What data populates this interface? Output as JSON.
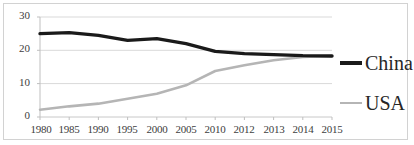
{
  "chart_data": {
    "type": "line",
    "title": "",
    "xlabel": "",
    "ylabel": "",
    "categories": [
      "1980",
      "1985",
      "1990",
      "1995",
      "2000",
      "2005",
      "2010",
      "2012",
      "2013",
      "2014",
      "2015"
    ],
    "series": [
      {
        "name": "China",
        "color": "#1a1a1a",
        "values": [
          25.0,
          25.3,
          24.5,
          23.0,
          23.5,
          22.0,
          19.7,
          19.0,
          18.7,
          18.4,
          18.3
        ]
      },
      {
        "name": "USA",
        "color": "#b5b5b5",
        "values": [
          2.2,
          3.2,
          4.0,
          5.5,
          7.0,
          9.5,
          13.8,
          15.5,
          17.0,
          18.0,
          18.3
        ]
      }
    ],
    "ylim": [
      0,
      30
    ],
    "y_ticks": [
      "0",
      "10",
      "20",
      "30"
    ],
    "grid": true,
    "legend_position": "right"
  },
  "legend": {
    "entries": [
      {
        "label": "China",
        "swatch": "line-swatch-china"
      },
      {
        "label": "USA",
        "swatch": "line-swatch-usa"
      }
    ]
  },
  "colors": {
    "china_line": "#1a1a1a",
    "usa_line": "#b5b5b5",
    "gridline": "#d9d9d9",
    "axis": "#bfbfbf",
    "border": "#d2d2d2",
    "tick_text": "#404040"
  }
}
